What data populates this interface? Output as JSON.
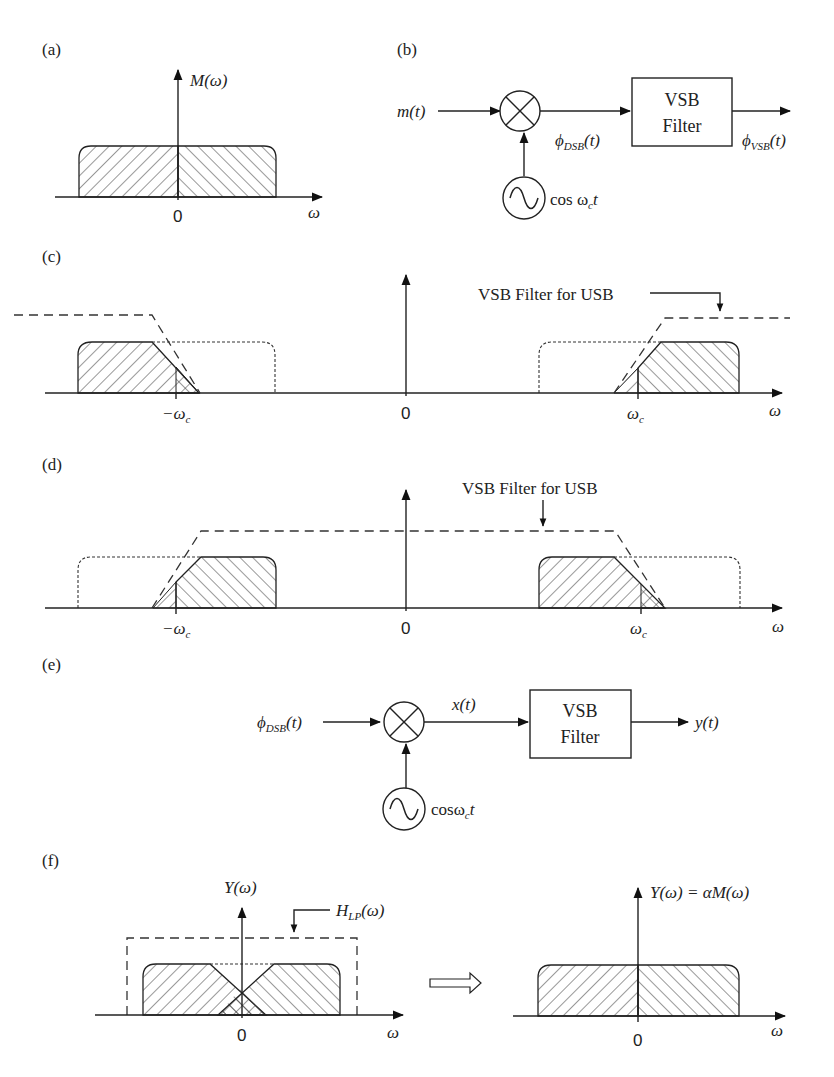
{
  "panels": {
    "a": {
      "label": "(a)",
      "y_axis": "M(ω)",
      "x_axis": "ω",
      "origin": "0"
    },
    "b": {
      "label": "(b)",
      "input": "m(t)",
      "mixer_output": "ϕ",
      "mixer_output_sub": "DSB",
      "mixer_output_tail": "(t)",
      "oscillator": "cos ω",
      "oscillator_sub": "c",
      "oscillator_tail": "t",
      "filter_line1": "VSB",
      "filter_line2": "Filter",
      "output": "ϕ",
      "output_sub": "VSB",
      "output_tail": "(t)"
    },
    "c": {
      "label": "(c)",
      "annotation": "VSB Filter for USB",
      "neg_carrier": "−ω",
      "pos_carrier": "ω",
      "carrier_sub": "c",
      "origin": "0",
      "x_axis": "ω"
    },
    "d": {
      "label": "(d)",
      "annotation": "VSB Filter for USB",
      "neg_carrier": "−ω",
      "pos_carrier": "ω",
      "carrier_sub": "c",
      "origin": "0",
      "x_axis": "ω"
    },
    "e": {
      "label": "(e)",
      "input": "ϕ",
      "input_sub": "DSB",
      "input_tail": "(t)",
      "mixer_output": "x(t)",
      "oscillator": "cosω",
      "oscillator_sub": "c",
      "oscillator_tail": "t",
      "filter_line1": "VSB",
      "filter_line2": "Filter",
      "output": "y(t)"
    },
    "f": {
      "label": "(f)",
      "left_y_axis": "Y(ω)",
      "filter_label": "H",
      "filter_label_sub": "LP",
      "filter_label_tail": "(ω)",
      "left_origin": "0",
      "left_x_axis": "ω",
      "right_y_axis": "Y(ω) = αM(ω)",
      "right_origin": "0",
      "right_x_axis": "ω"
    }
  }
}
